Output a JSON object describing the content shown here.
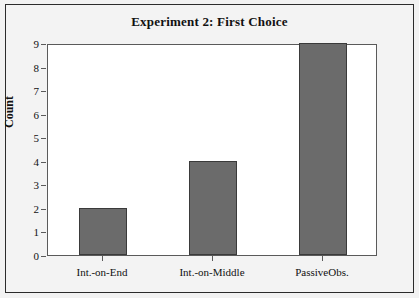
{
  "chart_data": {
    "type": "bar",
    "title": "Experiment 2: First Choice",
    "xlabel": "",
    "ylabel": "Count",
    "categories": [
      "Int.-on-End",
      "Int.-on-Middle",
      "PassiveObs."
    ],
    "values": [
      2,
      4,
      9
    ],
    "ylim": [
      0,
      9
    ],
    "y_ticks": [
      0,
      1,
      2,
      3,
      4,
      5,
      6,
      7,
      8,
      9
    ],
    "grid": false,
    "legend": null,
    "colors": {
      "bar_fill": "#6b6b6b",
      "bar_edge": "#3a3a3a",
      "plot_background": "#ffffff",
      "figure_background": "#f3f3f3",
      "frame": "#2b2b2b",
      "text": "#111111"
    }
  }
}
